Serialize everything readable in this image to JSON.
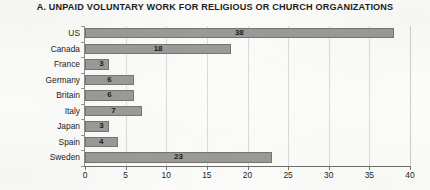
{
  "chart_data": {
    "type": "bar",
    "orientation": "horizontal",
    "title": "A. UNPAID VOLUNTARY WORK FOR RELIGIOUS OR CHURCH ORGANIZATIONS",
    "xlabel": "",
    "ylabel": "",
    "categories": [
      "US",
      "Canada",
      "France",
      "Germany",
      "Britain",
      "Italy",
      "Japan",
      "Spain",
      "Sweden"
    ],
    "values": [
      38,
      18,
      3,
      6,
      6,
      7,
      3,
      4,
      23
    ],
    "value_labels": [
      "38",
      "18",
      "3",
      "6",
      "6",
      "7",
      "3",
      "4",
      "23"
    ],
    "xlim": [
      0,
      40
    ],
    "xticks": [
      0,
      5,
      10,
      15,
      20,
      25,
      30,
      35,
      40
    ],
    "xtick_labels": [
      "0",
      "5",
      "10",
      "15",
      "20",
      "25",
      "30",
      "35",
      "40"
    ],
    "grid": "vertical",
    "legend": "none",
    "bar_color": "#9b9b99",
    "bar_border_color": "#77776f",
    "text_color": "#262321",
    "background_color": "#fdfdfb"
  }
}
